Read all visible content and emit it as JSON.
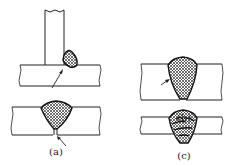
{
  "figure": {
    "panels": [
      {
        "id": "a",
        "label": "(a)",
        "description": "T-joint fillet weld with incomplete penetration (top) and butt weld with root gap (bottom)"
      },
      {
        "id": "b",
        "label": "(b)",
        "description": "Butt weld with lack of side-wall fusion indicated by arrow"
      },
      {
        "id": "c",
        "label": "(c)",
        "description": "Multi-pass butt weld with interpass lack of fusion"
      }
    ],
    "colors": {
      "line": "#222222",
      "hatch": "#333333",
      "background": "#ffffff"
    }
  }
}
